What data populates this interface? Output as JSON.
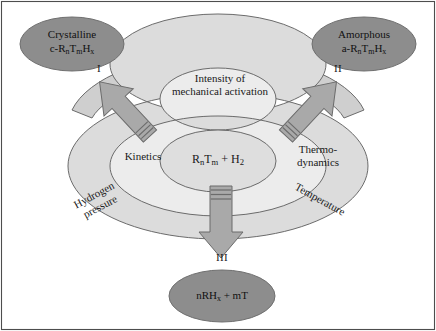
{
  "figure": {
    "border_color": "#4d4d4d",
    "background": "#ffffff"
  },
  "colors": {
    "dark_ellipse_fill": "#8d8d8d",
    "outer_ring_fill": "#dcdcdc",
    "mid_ring_fill": "#e8e8e8",
    "center_fill": "#dedede",
    "arc_band_fill": "#cfcfcf",
    "arrow_fill": "#a9a9a9",
    "stroke": "#6b6b6b",
    "text": "#1a1a1a"
  },
  "nodes": {
    "crystalline": {
      "line1": "Crystalline",
      "line2_prefix": "c-R",
      "line2_sub1": "n",
      "line2_mid": "T",
      "line2_sub2": "m",
      "line2_end": "H",
      "line2_sub3": "x",
      "roman": "I"
    },
    "amorphous": {
      "line1": "Amorphous",
      "line2_prefix": "a-R",
      "line2_sub1": "n",
      "line2_mid": "T",
      "line2_sub2": "m",
      "line2_end": "H",
      "line2_sub3": "x",
      "roman": "II"
    },
    "products": {
      "prefix": "nRH",
      "sub1": "x",
      "suffix": " + mT",
      "roman": "III"
    },
    "center": {
      "prefix": "R",
      "sub1": "n",
      "mid": "T",
      "sub2": "m",
      "plus": " + H",
      "sub3": "2"
    }
  },
  "rings": {
    "arc_band": {
      "line1": "Intensity of",
      "line2": "mechanical activation"
    },
    "kinetics": "Kinetics",
    "thermodynamics": {
      "line1": "Thermo-",
      "line2": "dynamics"
    },
    "hydrogen_pressure": {
      "line1": "Hydrogen",
      "line2": "pressure"
    },
    "temperature": "Temperature"
  },
  "arrows": {
    "left": "arrow-to-crystalline",
    "right": "arrow-to-amorphous",
    "down": "arrow-to-products"
  }
}
